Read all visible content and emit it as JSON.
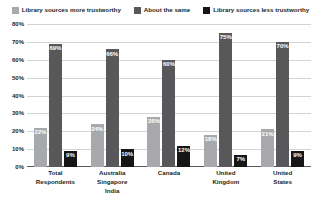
{
  "chart_data": {
    "type": "bar",
    "title": "",
    "xlabel": "",
    "ylabel": "",
    "ylim": [
      0,
      80
    ],
    "ytick_labels": [
      "0%",
      "10%",
      "20%",
      "30%",
      "40%",
      "50%",
      "60%",
      "70%",
      "80%"
    ],
    "ytick_values": [
      0,
      10,
      20,
      30,
      40,
      50,
      60,
      70,
      80
    ],
    "grid": true,
    "legend_position": "top",
    "categories": [
      "Total Respondents",
      "Australia Singapore India",
      "Canada",
      "United Kingdom",
      "United States"
    ],
    "category_lines": [
      [
        "Total",
        "Respondents"
      ],
      [
        "Australia",
        "Singapore",
        "India"
      ],
      [
        "Canada"
      ],
      [
        "United",
        "Kingdom"
      ],
      [
        "United",
        "States"
      ]
    ],
    "series": [
      {
        "name": "Library sources more trustworthy",
        "color": "#a7a9ac",
        "values": [
          22,
          24,
          28,
          18,
          21
        ],
        "labels": [
          "22%",
          "24%",
          "28%",
          "18%",
          "21%"
        ]
      },
      {
        "name": "About the same",
        "color": "#58585a",
        "values": [
          69,
          66,
          60,
          75,
          70
        ],
        "labels": [
          "69%",
          "66%",
          "60%",
          "75%",
          "70%"
        ]
      },
      {
        "name": "Library sources less trustworthy",
        "color": "#161616",
        "values": [
          9,
          10,
          12,
          7,
          9
        ],
        "labels": [
          "9%",
          "10%",
          "12%",
          "7%",
          "9%"
        ]
      }
    ]
  },
  "legend": {
    "items": [
      {
        "label": "Library sources more trustworthy",
        "color": "#a7a9ac"
      },
      {
        "label": "About the same",
        "color": "#58585a"
      },
      {
        "label": "Library sources less trustworthy",
        "color": "#161616"
      }
    ]
  }
}
